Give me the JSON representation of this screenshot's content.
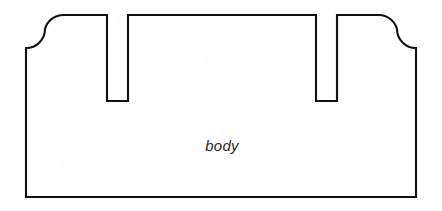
{
  "diagram": {
    "type": "engineering-cross-section",
    "title": "body",
    "background_color": "#ffffff",
    "stroke_color": "#111111",
    "stroke_width": 2.1,
    "label_color": "#2b2b2b",
    "canvas": {
      "width": 442,
      "height": 211
    },
    "labels": [
      {
        "name": "body",
        "text": "body",
        "x": 222,
        "y": 151,
        "style": "italic"
      }
    ],
    "geometry": {
      "description": "Rectangular body block with two narrow vertical slots cut into the top face and concave fillets at both upper outer corners",
      "outer": {
        "left_x": 26,
        "right_x": 416,
        "bottom_y": 197,
        "shoulder_y": 48,
        "top_y": 15
      },
      "fillets": [
        {
          "name": "left-fillet",
          "center_x": 45,
          "center_y": 48,
          "radius": 19,
          "concave": true
        },
        {
          "name": "right-fillet",
          "center_x": 397,
          "center_y": 48,
          "radius": 19,
          "concave": true
        }
      ],
      "top_plateaus": [
        {
          "name": "left-plateau",
          "x_start": 64,
          "x_end": 107,
          "y": 15
        },
        {
          "name": "center-plateau",
          "x_start": 128,
          "x_end": 316,
          "y": 15
        },
        {
          "name": "right-plateau",
          "x_start": 337,
          "x_end": 379,
          "y": 15
        }
      ],
      "slots": [
        {
          "name": "left-slot",
          "x_start": 107,
          "x_end": 128,
          "top_y": 15,
          "bottom_y": 101,
          "width": 21,
          "depth": 86
        },
        {
          "name": "right-slot",
          "x_start": 316,
          "x_end": 337,
          "top_y": 15,
          "bottom_y": 101,
          "width": 21,
          "depth": 86
        }
      ],
      "path": "M 26 197 L 26 48 L 26 48 A 19 19 0 0 0 45 29 L 45 29 A 19 19 0 0 1 64 15 L 107 15 L 107 101 L 128 101 L 128 15 L 316 15 L 316 101 L 337 101 L 337 15 L 379 15 A 19 19 0 0 1 397 29 A 19 19 0 0 0 416 48 L 416 197 Z"
    }
  }
}
